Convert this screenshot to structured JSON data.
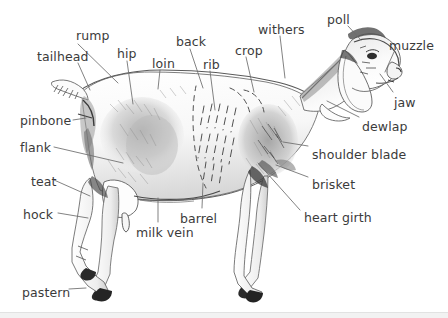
{
  "figure": {
    "background_color": "#ffffff",
    "label_color": "#3b3b3b",
    "leader_line_color": "#6b6b6b",
    "sketch_ink_color": "#4a4a4a",
    "width": 448,
    "height": 318
  },
  "labels": [
    {
      "id": "rump",
      "text": "rump",
      "x": 76,
      "y": 29,
      "anchor_x": 118,
      "anchor_y": 83,
      "tip_x": 78,
      "tip_y": 44
    },
    {
      "id": "tailhead",
      "text": "tailhead",
      "x": 37,
      "y": 50,
      "anchor_x": 90,
      "anchor_y": 90,
      "tip_x": 78,
      "tip_y": 63
    },
    {
      "id": "hip",
      "text": "hip",
      "x": 117,
      "y": 47,
      "anchor_x": 133,
      "anchor_y": 104,
      "tip_x": 127,
      "tip_y": 61
    },
    {
      "id": "loin",
      "text": "loin",
      "x": 152,
      "y": 57,
      "anchor_x": 158,
      "anchor_y": 89,
      "tip_x": 160,
      "tip_y": 70
    },
    {
      "id": "back",
      "text": "back",
      "x": 176,
      "y": 35,
      "anchor_x": 203,
      "anchor_y": 88,
      "tip_x": 190,
      "tip_y": 49
    },
    {
      "id": "rib",
      "text": "rib",
      "x": 203,
      "y": 58,
      "anchor_x": 215,
      "anchor_y": 110,
      "tip_x": 210,
      "tip_y": 71
    },
    {
      "id": "crop",
      "text": "crop",
      "x": 235,
      "y": 44,
      "anchor_x": 254,
      "anchor_y": 92,
      "tip_x": 246,
      "tip_y": 57
    },
    {
      "id": "withers",
      "text": "withers",
      "x": 258,
      "y": 23,
      "anchor_x": 285,
      "anchor_y": 78,
      "tip_x": 280,
      "tip_y": 36
    },
    {
      "id": "poll",
      "text": "poll",
      "x": 327,
      "y": 13,
      "anchor_x": 361,
      "anchor_y": 40,
      "tip_x": 348,
      "tip_y": 26
    },
    {
      "id": "muzzle",
      "text": "muzzle",
      "x": 389,
      "y": 39,
      "anchor_x": 385,
      "anchor_y": 72,
      "tip_x": 394,
      "tip_y": 52
    },
    {
      "id": "jaw",
      "text": "jaw",
      "x": 394,
      "y": 96,
      "anchor_x": 380,
      "anchor_y": 74,
      "tip_x": 393,
      "tip_y": 92
    },
    {
      "id": "dewlap",
      "text": "dewlap",
      "x": 362,
      "y": 120,
      "anchor_x": 327,
      "anchor_y": 101,
      "tip_x": 359,
      "tip_y": 117
    },
    {
      "id": "shoulder-blade",
      "text": "shoulder blade",
      "x": 312,
      "y": 148,
      "anchor_x": 283,
      "anchor_y": 142,
      "tip_x": 308,
      "tip_y": 146
    },
    {
      "id": "brisket",
      "text": "brisket",
      "x": 312,
      "y": 178,
      "anchor_x": 276,
      "anchor_y": 165,
      "tip_x": 308,
      "tip_y": 177
    },
    {
      "id": "heart-girth",
      "text": "heart girth",
      "x": 304,
      "y": 211,
      "anchor_x": 258,
      "anchor_y": 163,
      "tip_x": 300,
      "tip_y": 210
    },
    {
      "id": "pinbone",
      "text": "pinbone",
      "x": 20,
      "y": 114,
      "anchor_x": 86,
      "anchor_y": 118,
      "tip_x": 73,
      "tip_y": 120
    },
    {
      "id": "flank",
      "text": "flank",
      "x": 20,
      "y": 141,
      "anchor_x": 123,
      "anchor_y": 163,
      "tip_x": 54,
      "tip_y": 147
    },
    {
      "id": "teat",
      "text": "teat",
      "x": 31,
      "y": 175,
      "anchor_x": 90,
      "anchor_y": 196,
      "tip_x": 54,
      "tip_y": 180
    },
    {
      "id": "hock",
      "text": "hock",
      "x": 23,
      "y": 208,
      "anchor_x": 88,
      "anchor_y": 218,
      "tip_x": 58,
      "tip_y": 213
    },
    {
      "id": "pastern",
      "text": "pastern",
      "x": 22,
      "y": 286,
      "anchor_x": 86,
      "anchor_y": 288,
      "tip_x": 69,
      "tip_y": 289
    },
    {
      "id": "milk-vein",
      "text": "milk vein",
      "x": 136,
      "y": 226,
      "anchor_x": 158,
      "anchor_y": 198,
      "tip_x": 158,
      "tip_y": 222
    },
    {
      "id": "barrel",
      "text": "barrel",
      "x": 180,
      "y": 212,
      "anchor_x": 203,
      "anchor_y": 183,
      "tip_x": 202,
      "tip_y": 208
    }
  ],
  "anatomy_parts": [
    "rump",
    "tailhead",
    "hip",
    "loin",
    "back",
    "rib",
    "crop",
    "withers",
    "poll",
    "muzzle",
    "jaw",
    "dewlap",
    "shoulder blade",
    "brisket",
    "heart girth",
    "pinbone",
    "flank",
    "teat",
    "hock",
    "pastern",
    "milk vein",
    "barrel"
  ]
}
